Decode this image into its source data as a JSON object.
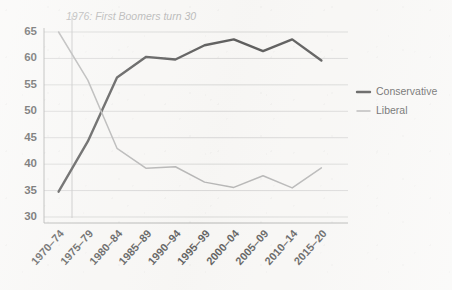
{
  "chart_data": {
    "type": "line",
    "title": "",
    "subtitle": "",
    "xlabel": "",
    "ylabel": "",
    "categories": [
      "1970–74",
      "1975–79",
      "1980–84",
      "1985–89",
      "1990–94",
      "1995–99",
      "2000–04",
      "2005–09",
      "2010–14",
      "2015–20"
    ],
    "yticks": [
      30,
      35,
      40,
      45,
      50,
      55,
      60,
      65
    ],
    "ylim": [
      30,
      65
    ],
    "grid": "horizontal",
    "legend_position": "right",
    "series": [
      {
        "name": "Conservative",
        "color": "#1a1a1a",
        "width": 2.4,
        "values": [
          34.8,
          44.3,
          56.4,
          60.3,
          59.8,
          62.5,
          63.6,
          61.4,
          63.6,
          59.6
        ]
      },
      {
        "name": "Liberal",
        "color": "#9b9b9b",
        "width": 1.5,
        "values": [
          65.0,
          55.9,
          43.0,
          39.2,
          39.5,
          36.6,
          35.6,
          37.8,
          35.5,
          39.3
        ]
      }
    ],
    "annotations": [
      {
        "name": "boomers-marker",
        "text": "1976: First Boomers turn 30",
        "x_value": 1976,
        "marker_color": "#b3b3b3"
      }
    ]
  },
  "legend": {
    "items": [
      {
        "label": "Conservative",
        "color": "#1a1a1a",
        "width": 2.4
      },
      {
        "label": "Liberal",
        "color": "#9b9b9b",
        "width": 1.5
      }
    ]
  },
  "colors": {
    "background": "#f8f7f5",
    "grid": "#b9b9b9",
    "axis": "#8f8f8f",
    "text": "#1d1d1d",
    "annotation": "#9a9a9a"
  }
}
